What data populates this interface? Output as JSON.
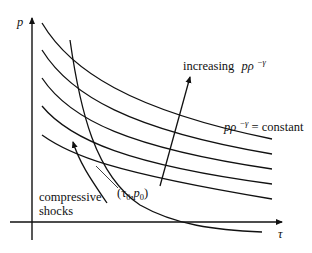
{
  "axes": {
    "y_label": "p",
    "x_label": "τ"
  },
  "labels": {
    "increasing": "increasing",
    "increasing_expr": "pρ",
    "increasing_exp": "−γ",
    "constant_expr": "pρ",
    "constant_exp": "−γ",
    "constant_suffix": " = constant",
    "point": "(τ",
    "point_sub0": "0",
    "point_mid": ",p",
    "point_sub1": "0",
    "point_close": ")",
    "compressive": "compressive",
    "shocks": "shocks"
  },
  "isentropes": [
    {
      "name": "isentrope-1",
      "path": "M42,23 C70,70 130,110 272,139"
    },
    {
      "name": "isentrope-2",
      "path": "M42,50 C70,95 130,130 272,154"
    },
    {
      "name": "isentrope-3",
      "path": "M42,78 C70,120 130,148 272,169"
    },
    {
      "name": "isentrope-4",
      "path": "M42,106 C70,140 130,165 272,184"
    },
    {
      "name": "isentrope-5",
      "path": "M42,135 C70,155 110,172 272,199"
    }
  ],
  "hugoniot": {
    "path": "M70,40 C80,110 95,175 140,205 C175,225 215,230 262,232"
  },
  "colors": {
    "ink": "#111111",
    "background": "#ffffff"
  }
}
